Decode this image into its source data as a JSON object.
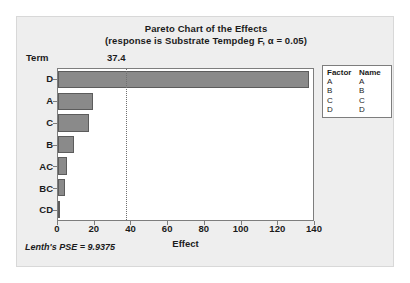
{
  "chart_data": {
    "type": "bar",
    "orientation": "horizontal",
    "title": "Pareto Chart of the Effects",
    "subtitle": "(response is Substrate Tempdeg F, α = 0.05)",
    "xlabel": "Effect",
    "ylabel": "Term",
    "categories": [
      "D",
      "A",
      "C",
      "B",
      "AC",
      "BC",
      "CD"
    ],
    "values": [
      138,
      19,
      17,
      9,
      5,
      4,
      0.5
    ],
    "xlim": [
      0,
      140
    ],
    "xticks": [
      "0",
      "20",
      "40",
      "60",
      "80",
      "100",
      "120",
      "140"
    ],
    "xtick_values": [
      0,
      20,
      40,
      60,
      80,
      100,
      120,
      140
    ],
    "grid": false,
    "reference_line": {
      "label": "37.4",
      "value": 37.4,
      "style": "dotted"
    },
    "annotation": "Lenth's PSE = 9.9375",
    "bar_color": "#8a8a8a",
    "bar_border_color": "#5c5c5c"
  },
  "legend": {
    "position": "right",
    "headers": [
      "Factor",
      "Name"
    ],
    "rows": [
      {
        "factor": "A",
        "name": "A"
      },
      {
        "factor": "B",
        "name": "B"
      },
      {
        "factor": "C",
        "name": "C"
      },
      {
        "factor": "D",
        "name": "D"
      }
    ]
  }
}
